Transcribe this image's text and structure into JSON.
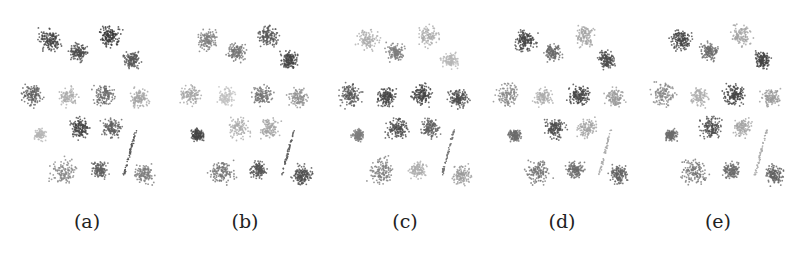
{
  "figure": {
    "panels": [
      {
        "label": "(a)",
        "x": 12,
        "shades": [
          0.85,
          0.8,
          0.9,
          0.75,
          0.7,
          0.3,
          0.65,
          0.35,
          0.25,
          0.85,
          0.7,
          0.75,
          0.5,
          0.7,
          0.55,
          0.45
        ]
      },
      {
        "label": "(b)",
        "x": 170,
        "shades": [
          0.55,
          0.6,
          0.75,
          0.85,
          0.35,
          0.2,
          0.6,
          0.45,
          0.85,
          0.3,
          0.35,
          0.7,
          0.6,
          0.75,
          0.8,
          0.8
        ]
      },
      {
        "label": "(c)",
        "x": 330,
        "shades": [
          0.3,
          0.55,
          0.3,
          0.25,
          0.75,
          0.85,
          0.85,
          0.8,
          0.55,
          0.8,
          0.7,
          0.6,
          0.55,
          0.3,
          0.4,
          0.5
        ]
      },
      {
        "label": "(d)",
        "x": 487,
        "shades": [
          0.85,
          0.65,
          0.35,
          0.8,
          0.5,
          0.3,
          0.85,
          0.4,
          0.65,
          0.8,
          0.35,
          0.3,
          0.6,
          0.65,
          0.7,
          0.65
        ]
      },
      {
        "label": "(e)",
        "x": 643,
        "shades": [
          0.85,
          0.65,
          0.35,
          0.85,
          0.5,
          0.3,
          0.85,
          0.4,
          0.65,
          0.8,
          0.35,
          0.3,
          0.6,
          0.65,
          0.7,
          0.65
        ]
      }
    ]
  }
}
